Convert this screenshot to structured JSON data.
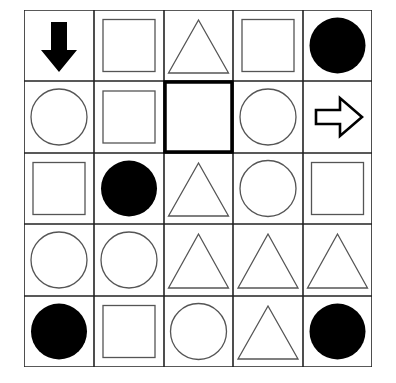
{
  "puzzle": {
    "rows": 5,
    "cols": 5,
    "highlight": {
      "row": 1,
      "col": 2
    },
    "cells": [
      [
        "arrow-down-filled",
        "square",
        "triangle",
        "square",
        "circle-filled"
      ],
      [
        "circle",
        "square",
        "empty",
        "circle",
        "arrow-right-outline"
      ],
      [
        "square",
        "circle-filled",
        "triangle",
        "circle",
        "square"
      ],
      [
        "circle",
        "circle",
        "triangle",
        "triangle",
        "triangle"
      ],
      [
        "circle-filled",
        "square",
        "circle",
        "triangle",
        "circle-filled"
      ]
    ]
  },
  "colors": {
    "line": "#222222",
    "shape_stroke": "#555555",
    "fill": "#000000",
    "background": "#ffffff"
  }
}
